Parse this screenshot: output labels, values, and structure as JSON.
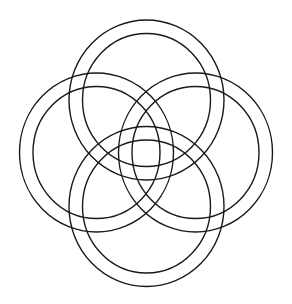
{
  "diagram": {
    "canvas": {
      "width": 292,
      "height": 304,
      "background": "#ffffff"
    },
    "stroke_color": "#1a1a1a",
    "rings": [
      {
        "name": "top",
        "cx": 146.5,
        "cy": 100,
        "outer": {
          "rx": 77.5,
          "ry": 80
        },
        "inner": {
          "rx": 64,
          "ry": 66.5
        }
      },
      {
        "name": "left",
        "cx": 96.5,
        "cy": 152.5,
        "outer": {
          "rx": 77,
          "ry": 79.5
        },
        "inner": {
          "rx": 63.5,
          "ry": 66
        }
      },
      {
        "name": "right",
        "cx": 195.5,
        "cy": 152.5,
        "outer": {
          "rx": 77,
          "ry": 79.5
        },
        "inner": {
          "rx": 63.5,
          "ry": 66
        }
      },
      {
        "name": "bottom",
        "cx": 146.5,
        "cy": 206.5,
        "outer": {
          "rx": 77.5,
          "ry": 80
        },
        "inner": {
          "rx": 64,
          "ry": 66.5
        }
      }
    ]
  }
}
